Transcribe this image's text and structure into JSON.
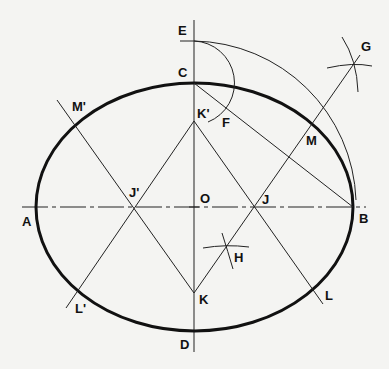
{
  "colors": {
    "background": "#f4f4f2",
    "ink": "#111111"
  },
  "points": {
    "A": {
      "label": "A",
      "x": 36,
      "y": 207
    },
    "B": {
      "label": "B",
      "x": 353,
      "y": 207
    },
    "C": {
      "label": "C",
      "x": 194,
      "y": 83
    },
    "D": {
      "label": "D",
      "x": 194,
      "y": 330
    },
    "E": {
      "label": "E",
      "x": 194,
      "y": 41
    },
    "F": {
      "label": "F",
      "x": 216,
      "y": 118
    },
    "G": {
      "label": "G",
      "x": 353,
      "y": 66
    },
    "H": {
      "label": "H",
      "x": 226,
      "y": 248
    },
    "O": {
      "label": "O",
      "x": 194,
      "y": 207
    },
    "J": {
      "label": "J",
      "x": 254,
      "y": 207
    },
    "J_prime": {
      "label": "J'",
      "x": 134,
      "y": 207
    },
    "K": {
      "label": "K",
      "x": 194,
      "y": 293
    },
    "K_prime": {
      "label": "K'",
      "x": 194,
      "y": 121
    },
    "M": {
      "label": "M",
      "x": 313,
      "y": 122
    },
    "M_prime": {
      "label": "M'",
      "x": 75,
      "y": 125
    },
    "L": {
      "label": "L",
      "x": 314,
      "y": 290
    },
    "L_prime": {
      "label": "L'",
      "x": 77,
      "y": 292
    }
  },
  "labels": {
    "A": "A",
    "B": "B",
    "C": "C",
    "D": "D",
    "E": "E",
    "F": "F",
    "G": "G",
    "H": "H",
    "O": "O",
    "J": "J",
    "J_prime": "J'",
    "K": "K",
    "K_prime": "K'",
    "M": "M",
    "M_prime": "M'",
    "L": "L",
    "L_prime": "L'"
  }
}
